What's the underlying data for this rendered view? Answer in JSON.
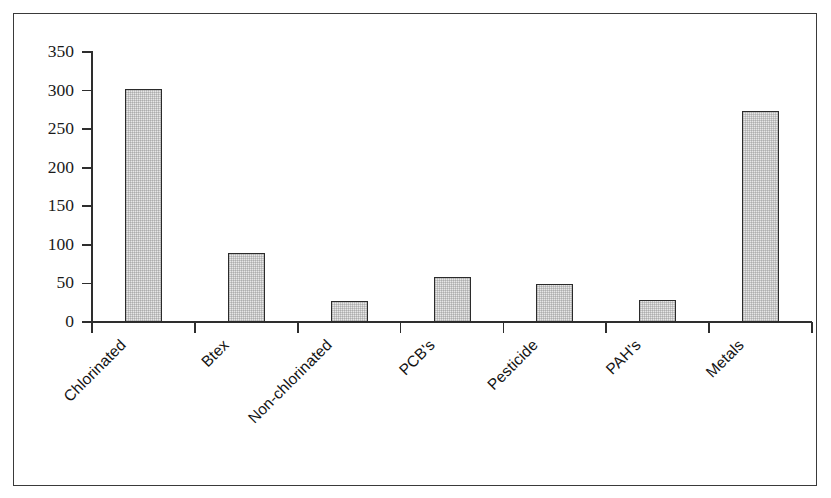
{
  "chart_data": {
    "type": "bar",
    "title": "",
    "subtitle": "",
    "xlabel": "",
    "ylabel": "",
    "categories": [
      "Chlorinated",
      "Btex",
      "Non-chlorinated",
      "PCB's",
      "Pesticide",
      "PAH's",
      "Metals"
    ],
    "values": [
      302,
      90,
      27,
      59,
      49,
      29,
      273
    ],
    "ylim": [
      0,
      350
    ],
    "ytick_labels": [
      "0",
      "50",
      "100",
      "150",
      "200",
      "250",
      "300",
      "350"
    ],
    "ytick_values": [
      0,
      50,
      100,
      150,
      200,
      250,
      300,
      350
    ],
    "grid": false,
    "legend": false,
    "legend_position": "none",
    "bar_fill_color": "#e7e7e7",
    "bar_edge_color": "#2b2b2b",
    "axis_color": "#2e2e2e",
    "frame_color": "#3a3a3a",
    "background_color": "#ffffff",
    "xtick_label_rotation": -45
  }
}
